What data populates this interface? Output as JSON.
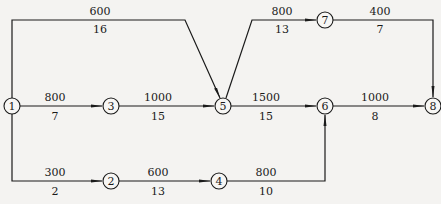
{
  "diagram": {
    "type": "activity-network",
    "nodes": [
      {
        "id": "1",
        "label": "1",
        "x": 12,
        "y": 106
      },
      {
        "id": "2",
        "label": "2",
        "x": 111,
        "y": 181
      },
      {
        "id": "3",
        "label": "3",
        "x": 111,
        "y": 106
      },
      {
        "id": "4",
        "label": "4",
        "x": 219,
        "y": 181
      },
      {
        "id": "5",
        "label": "5",
        "x": 223,
        "y": 106
      },
      {
        "id": "6",
        "label": "6",
        "x": 325,
        "y": 106
      },
      {
        "id": "7",
        "label": "7",
        "x": 325,
        "y": 20
      },
      {
        "id": "8",
        "label": "8",
        "x": 433,
        "y": 106
      }
    ],
    "edges": [
      {
        "from": "1",
        "to": "5",
        "top": "600",
        "bottom": "16"
      },
      {
        "from": "1",
        "to": "3",
        "top": "800",
        "bottom": "7"
      },
      {
        "from": "1",
        "to": "2",
        "top": "300",
        "bottom": "2"
      },
      {
        "from": "3",
        "to": "5",
        "top": "1000",
        "bottom": "15"
      },
      {
        "from": "2",
        "to": "4",
        "top": "600",
        "bottom": "13"
      },
      {
        "from": "5",
        "to": "7",
        "top": "800",
        "bottom": "13"
      },
      {
        "from": "5",
        "to": "6",
        "top": "1500",
        "bottom": "15"
      },
      {
        "from": "4",
        "to": "6",
        "top": "800",
        "bottom": "10"
      },
      {
        "from": "7",
        "to": "8",
        "top": "400",
        "bottom": "7"
      },
      {
        "from": "6",
        "to": "8",
        "top": "1000",
        "bottom": "8"
      }
    ]
  }
}
